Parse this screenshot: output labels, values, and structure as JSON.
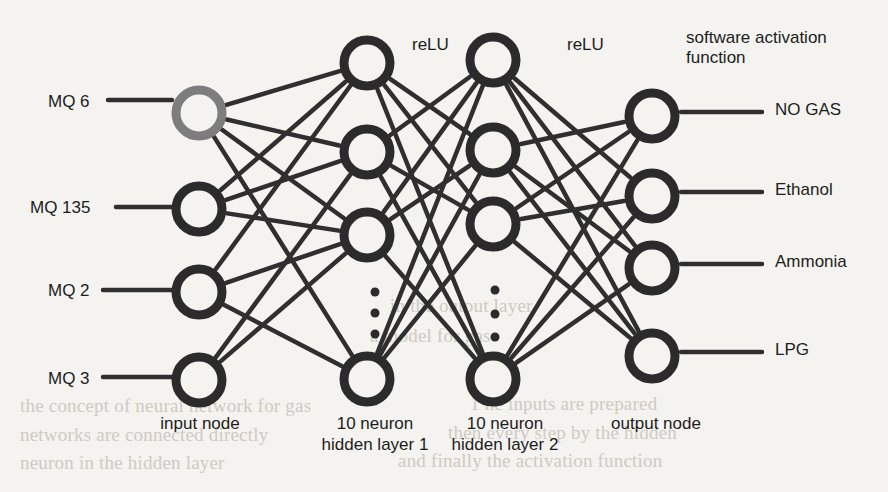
{
  "figure": {
    "background_color": "#f4f3ef",
    "ink_color": "#2b2b2b",
    "highlight_node_color": "#7d7d7d",
    "width": 888,
    "height": 492
  },
  "input_labels": [
    {
      "text": "MQ 6",
      "x": 48,
      "y": 92
    },
    {
      "text": "MQ 135",
      "x": 30,
      "y": 198
    },
    {
      "text": "MQ 2",
      "x": 48,
      "y": 281
    },
    {
      "text": "MQ 3",
      "x": 48,
      "y": 369
    }
  ],
  "output_labels": [
    {
      "text": "NO GAS",
      "x": 775,
      "y": 100
    },
    {
      "text": "Ethanol",
      "x": 775,
      "y": 180
    },
    {
      "text": "Ammonia",
      "x": 775,
      "y": 252
    },
    {
      "text": "LPG",
      "x": 775,
      "y": 340
    }
  ],
  "annotations": [
    {
      "name": "relu-hidden-1",
      "text": "reLU",
      "x": 412,
      "y": 35
    },
    {
      "name": "relu-hidden-2",
      "text": "reLU",
      "x": 567,
      "y": 35
    },
    {
      "name": "softmax-note",
      "text": "software activation\nfunction",
      "x": 686,
      "y": 28
    }
  ],
  "layer_captions": [
    {
      "name": "input-layer-caption",
      "text": "input node",
      "x": 130,
      "y": 413,
      "width": 140
    },
    {
      "name": "hidden-1-layer-caption",
      "text": "10 neuron\nhidden layer 1",
      "x": 300,
      "y": 413,
      "width": 150
    },
    {
      "name": "hidden-2-layer-caption",
      "text": "10 neuron\nhidden layer 2",
      "x": 430,
      "y": 413,
      "width": 150
    },
    {
      "name": "output-layer-caption",
      "text": "output node",
      "x": 586,
      "y": 413,
      "width": 140
    }
  ],
  "chart_data": {
    "type": "diagram",
    "node_radius": 23,
    "node_stroke": 9,
    "dot_radius": 4.5,
    "layers": [
      {
        "name": "input",
        "caption": "input node",
        "x": 199,
        "nodes": [
          {
            "id": "i0",
            "y": 113,
            "color": "#7d7d7d",
            "label": "MQ 6"
          },
          {
            "id": "i1",
            "y": 209,
            "color": "#2b2b2b",
            "label": "MQ 135"
          },
          {
            "id": "i2",
            "y": 292,
            "color": "#2b2b2b",
            "label": "MQ 2"
          },
          {
            "id": "i3",
            "y": 380,
            "color": "#2b2b2b",
            "label": "MQ 3"
          }
        ],
        "ellipsis": null
      },
      {
        "name": "hidden1",
        "caption": "10 neuron hidden layer 1",
        "x": 367,
        "nodes": [
          {
            "id": "h0",
            "y": 63,
            "color": "#2b2b2b"
          },
          {
            "id": "h1",
            "y": 152,
            "color": "#2b2b2b"
          },
          {
            "id": "h2",
            "y": 235,
            "color": "#2b2b2b"
          },
          {
            "id": "h3",
            "y": 379,
            "color": "#2b2b2b"
          }
        ],
        "ellipsis": {
          "x": 375,
          "ys": [
            292,
            313,
            334
          ]
        }
      },
      {
        "name": "hidden2",
        "caption": "10 neuron hidden layer 2",
        "x": 493,
        "nodes": [
          {
            "id": "g0",
            "y": 60,
            "color": "#2b2b2b"
          },
          {
            "id": "g1",
            "y": 150,
            "color": "#2b2b2b"
          },
          {
            "id": "g2",
            "y": 224,
            "color": "#2b2b2b"
          },
          {
            "id": "g3",
            "y": 379,
            "color": "#2b2b2b"
          }
        ],
        "ellipsis": {
          "x": 495,
          "ys": [
            290,
            314,
            337
          ]
        }
      },
      {
        "name": "output",
        "caption": "output node",
        "x": 652,
        "nodes": [
          {
            "id": "o0",
            "y": 116,
            "color": "#2b2b2b",
            "label": "NO GAS"
          },
          {
            "id": "o1",
            "y": 196,
            "color": "#2b2b2b",
            "label": "Ethanol"
          },
          {
            "id": "o2",
            "y": 268,
            "color": "#2b2b2b",
            "label": "Ammonia"
          },
          {
            "id": "o3",
            "y": 356,
            "color": "#2b2b2b",
            "label": "LPG"
          }
        ],
        "ellipsis": null
      }
    ],
    "input_stubs": [
      {
        "from_x": 108,
        "to_x": 172,
        "y": 100
      },
      {
        "from_x": 116,
        "to_x": 172,
        "y": 207
      },
      {
        "from_x": 103,
        "to_x": 172,
        "y": 290
      },
      {
        "from_x": 103,
        "to_x": 172,
        "y": 377
      }
    ],
    "output_stubs": [
      {
        "from_x": 681,
        "to_x": 762,
        "y": 112
      },
      {
        "from_x": 681,
        "to_x": 762,
        "y": 192
      },
      {
        "from_x": 681,
        "to_x": 762,
        "y": 264
      },
      {
        "from_x": 681,
        "to_x": 762,
        "y": 352
      }
    ],
    "edges": [
      [
        "i0",
        "h0"
      ],
      [
        "i0",
        "h1"
      ],
      [
        "i0",
        "h2"
      ],
      [
        "i0",
        "h3"
      ],
      [
        "i1",
        "h1"
      ],
      [
        "i1",
        "h2"
      ],
      [
        "i1",
        "h0"
      ],
      [
        "i2",
        "h0"
      ],
      [
        "i2",
        "h2"
      ],
      [
        "i2",
        "h3"
      ],
      [
        "i3",
        "h1"
      ],
      [
        "i3",
        "h2"
      ],
      [
        "h0",
        "g1"
      ],
      [
        "h0",
        "g2"
      ],
      [
        "h0",
        "g3"
      ],
      [
        "h1",
        "g0"
      ],
      [
        "h1",
        "g2"
      ],
      [
        "h1",
        "g3"
      ],
      [
        "h2",
        "g0"
      ],
      [
        "h2",
        "g1"
      ],
      [
        "h2",
        "g3"
      ],
      [
        "h3",
        "g0"
      ],
      [
        "h3",
        "g1"
      ],
      [
        "h3",
        "g2"
      ],
      [
        "g0",
        "o1"
      ],
      [
        "g0",
        "o2"
      ],
      [
        "g0",
        "o3"
      ],
      [
        "g1",
        "o0"
      ],
      [
        "g1",
        "o2"
      ],
      [
        "g1",
        "o3"
      ],
      [
        "g2",
        "o0"
      ],
      [
        "g2",
        "o1"
      ],
      [
        "g2",
        "o3"
      ],
      [
        "g3",
        "o0"
      ],
      [
        "g3",
        "o1"
      ],
      [
        "g3",
        "o2"
      ]
    ],
    "edge_width": 4.5,
    "edge_color": "#2f2f2f"
  },
  "background_bleed": [
    {
      "text": "the concept of neural network for gas",
      "x": 20,
      "y": 395,
      "size": 19
    },
    {
      "text": "1 he inputs are prepared",
      "x": 470,
      "y": 393,
      "size": 19
    },
    {
      "text": "networks are connected directly",
      "x": 20,
      "y": 424,
      "size": 19
    },
    {
      "text": "then every step by the hidden",
      "x": 448,
      "y": 422,
      "size": 19
    },
    {
      "text": "neuron in the hidden layer",
      "x": 20,
      "y": 452,
      "size": 19
    },
    {
      "text": "and finally the activation function",
      "x": 398,
      "y": 450,
      "size": 19
    },
    {
      "text": "in the output layer",
      "x": 390,
      "y": 295,
      "size": 19
    },
    {
      "text": "a model for gas",
      "x": 370,
      "y": 325,
      "size": 19
    }
  ]
}
